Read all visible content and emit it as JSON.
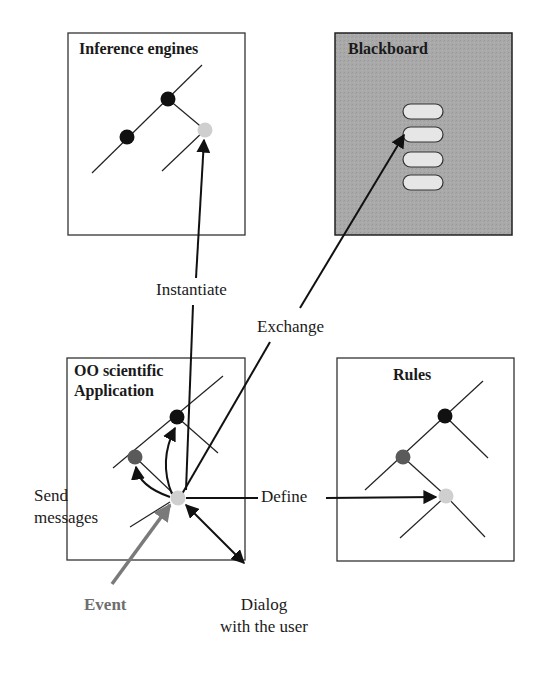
{
  "diagram": {
    "boxes": [
      {
        "id": "inference-engines",
        "title": "Inference engines",
        "fill": "#ffffff"
      },
      {
        "id": "blackboard",
        "title": "Blackboard",
        "fill": "#a8a8a8"
      },
      {
        "id": "oo-application",
        "title_line1": "OO scientific",
        "title_line2": "Application",
        "fill": "#ffffff"
      },
      {
        "id": "rules",
        "title": "Rules",
        "fill": "#ffffff"
      }
    ],
    "labels": {
      "instantiate": "Instantiate",
      "exchange": "Exchange",
      "send_messages_line1": "Send",
      "send_messages_line2": "messages",
      "define": "Define",
      "event": "Event",
      "dialog_line1": "Dialog",
      "dialog_line2": "with the user"
    },
    "colors": {
      "node_black": "#111111",
      "node_dark_gray": "#5a5a5a",
      "node_light_gray": "#cfcfcf",
      "event_arrow": "#7a7a7a",
      "blackboard_fill": "#a8a8a8",
      "slot_fill": "#e6e6e6"
    },
    "blackboard_slots": 4
  }
}
